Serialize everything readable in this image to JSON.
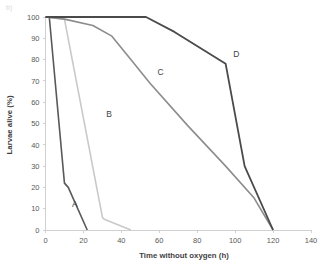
{
  "figure": {
    "corner_mark": "b)",
    "background": "#ffffff"
  },
  "chart_data": {
    "type": "line",
    "title": "",
    "xlabel": "Time without oxygen (h)",
    "ylabel": "Larvae alive (%)",
    "xlim": [
      0,
      140
    ],
    "ylim": [
      0,
      100
    ],
    "xticks": [
      0,
      20,
      40,
      60,
      80,
      100,
      120,
      140
    ],
    "yticks": [
      0,
      10,
      20,
      30,
      40,
      50,
      60,
      70,
      80,
      90,
      100
    ],
    "xtick_labels": [
      "0",
      "20",
      "40",
      "60",
      "80",
      "100",
      "120",
      "140"
    ],
    "ytick_labels": [
      "0",
      "10",
      "20",
      "30",
      "40",
      "50",
      "60",
      "70",
      "80",
      "90",
      "100"
    ],
    "grid": false,
    "legend_position": "inline-annotations",
    "series": [
      {
        "name": "A",
        "color": "#595959",
        "width": 1.6,
        "label_x": 14,
        "label_y": 11,
        "x": [
          0,
          2,
          10,
          12,
          22
        ],
        "y": [
          100,
          100,
          22,
          20,
          0
        ]
      },
      {
        "name": "B",
        "color": "#c9c9c9",
        "width": 1.6,
        "label_x": 32,
        "label_y": 53,
        "x": [
          0,
          10,
          30,
          31,
          45
        ],
        "y": [
          100,
          99,
          6,
          5,
          0
        ]
      },
      {
        "name": "C",
        "color": "#8c8c8c",
        "width": 1.6,
        "label_x": 59,
        "label_y": 73,
        "x": [
          0,
          10,
          25,
          35,
          45,
          55,
          75,
          95,
          110,
          120
        ],
        "y": [
          100,
          99,
          96,
          91,
          80,
          69,
          49,
          30,
          15,
          0
        ]
      },
      {
        "name": "D",
        "color": "#4a4a4a",
        "width": 1.8,
        "label_x": 99,
        "label_y": 81,
        "x": [
          0,
          53,
          68,
          95,
          105,
          120
        ],
        "y": [
          100,
          100,
          93,
          78,
          30,
          0
        ]
      }
    ]
  }
}
